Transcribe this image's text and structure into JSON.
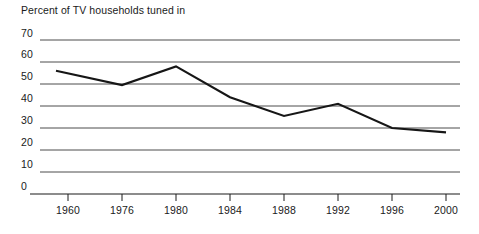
{
  "chart_data": {
    "type": "line",
    "title": "Percent of TV households tuned in",
    "xlabel": "",
    "ylabel": "",
    "x": [
      "1960",
      "1976",
      "1980",
      "1984",
      "1988",
      "1992",
      "1996",
      "2000"
    ],
    "categories": [
      "1960",
      "1976",
      "1980",
      "1984",
      "1988",
      "1992",
      "1996",
      "2000"
    ],
    "values": [
      56,
      49.5,
      58,
      44,
      35.5,
      41,
      30,
      28
    ],
    "series": [
      {
        "name": "Percent of TV households tuned in",
        "values": [
          56,
          49.5,
          58,
          44,
          35.5,
          41,
          30,
          28
        ]
      }
    ],
    "ylim": [
      0,
      70
    ],
    "yticks": [
      0,
      10,
      20,
      30,
      40,
      50,
      60,
      70
    ],
    "ytick_labels": [
      "0",
      "10",
      "20",
      "30",
      "40",
      "50",
      "60",
      "70"
    ],
    "xtick_labels": [
      "1960",
      "1976",
      "1980",
      "1984",
      "1988",
      "1992",
      "1996",
      "2000"
    ],
    "grid": true,
    "grid_axis": "y",
    "legend": false,
    "legend_position": "none",
    "line_color": "#161616",
    "grid_color": "#555555",
    "axis_color": "#1a1a1a",
    "background_color": "#ffffff"
  },
  "axis": {
    "y_labels": [
      "70",
      "60",
      "50",
      "40",
      "30",
      "20",
      "10",
      "0"
    ],
    "x_labels": [
      "1960",
      "1976",
      "1980",
      "1984",
      "1988",
      "1992",
      "1996",
      "2000"
    ]
  }
}
